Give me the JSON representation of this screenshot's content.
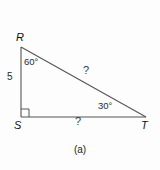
{
  "figure": {
    "caption": "(a)",
    "shape": "right-triangle",
    "stroke_color": "#555555",
    "background_color": "#fdfdfd",
    "vertices": [
      {
        "name": "R",
        "label": "R",
        "x": 21,
        "y": 47
      },
      {
        "name": "S",
        "label": "S",
        "x": 21,
        "y": 117
      },
      {
        "name": "T",
        "label": "T",
        "x": 146,
        "y": 117
      }
    ],
    "angles": [
      {
        "at": "R",
        "label": "60°",
        "value": 60
      },
      {
        "at": "S",
        "label": "",
        "value": 90,
        "marker": "right-angle-square"
      },
      {
        "at": "T",
        "label": "30°",
        "value": 30
      }
    ],
    "sides": [
      {
        "name": "RS",
        "label": "5",
        "known": true
      },
      {
        "name": "RT",
        "label": "?",
        "known": false
      },
      {
        "name": "ST",
        "label": "?",
        "known": false
      }
    ]
  }
}
